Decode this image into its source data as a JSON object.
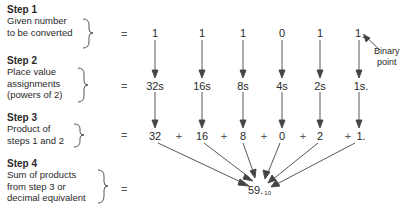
{
  "steps": [
    {
      "title": "Step 1",
      "description": "Given number\nto be converted"
    },
    {
      "title": "Step 2",
      "description": "Place value\nassignments\n(powers of 2)"
    },
    {
      "title": "Step 3",
      "description": "Product of\nsteps 1 and 2"
    },
    {
      "title": "Step 4",
      "description": "Sum of products\nfrom step 3 or\ndecimal equivalent"
    }
  ],
  "equals": "=",
  "row1": {
    "values": [
      "1",
      "1",
      "1",
      "0",
      "1",
      "1"
    ],
    "last_subscript": "2"
  },
  "row2": {
    "values": [
      "32s",
      "16s",
      "8s",
      "4s",
      "2s",
      "1s."
    ]
  },
  "row3": {
    "values": [
      "32",
      "16",
      "8",
      "0",
      "2",
      "1."
    ],
    "operator": "+"
  },
  "result": {
    "value": "59.",
    "subscript": "10"
  },
  "annotation": {
    "label": "Binary\npoint"
  }
}
